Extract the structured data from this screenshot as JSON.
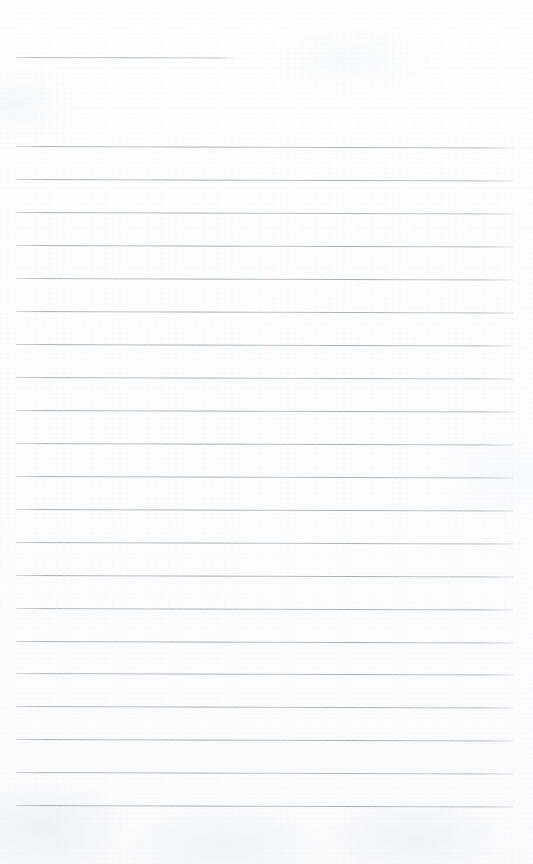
{
  "page": {
    "kind": "blank-ruled-paper",
    "width_px": 533,
    "height_px": 864,
    "background_color": "#fefefe",
    "paper_tone": "off-white",
    "visible_text": "",
    "text_content_note": "no handwriting, no printed text, no page numbers — page is blank"
  },
  "ruling": {
    "line_color": "#a5aab1",
    "line_thickness_px": 1,
    "line_spacing_px": 33,
    "skew_degrees": 0.16,
    "left_margin_px": 16,
    "right_edge_px": 513,
    "full_line_count": 21,
    "short_line_count": 1,
    "total_line_count": 22,
    "lines": [
      {
        "index": 0,
        "y": 57,
        "x_start": 16,
        "x_end": 234,
        "type": "short"
      },
      {
        "index": 1,
        "y": 146,
        "x_start": 16,
        "x_end": 513,
        "type": "full"
      },
      {
        "index": 2,
        "y": 179,
        "x_start": 16,
        "x_end": 513,
        "type": "full"
      },
      {
        "index": 3,
        "y": 212,
        "x_start": 16,
        "x_end": 513,
        "type": "full"
      },
      {
        "index": 4,
        "y": 245,
        "x_start": 16,
        "x_end": 513,
        "type": "full"
      },
      {
        "index": 5,
        "y": 278,
        "x_start": 16,
        "x_end": 513,
        "type": "full"
      },
      {
        "index": 6,
        "y": 311,
        "x_start": 16,
        "x_end": 513,
        "type": "full"
      },
      {
        "index": 7,
        "y": 344,
        "x_start": 16,
        "x_end": 513,
        "type": "full"
      },
      {
        "index": 8,
        "y": 377,
        "x_start": 16,
        "x_end": 513,
        "type": "full"
      },
      {
        "index": 9,
        "y": 410,
        "x_start": 16,
        "x_end": 513,
        "type": "full"
      },
      {
        "index": 10,
        "y": 443,
        "x_start": 16,
        "x_end": 513,
        "type": "full"
      },
      {
        "index": 11,
        "y": 476,
        "x_start": 16,
        "x_end": 513,
        "type": "full"
      },
      {
        "index": 12,
        "y": 509,
        "x_start": 16,
        "x_end": 513,
        "type": "full"
      },
      {
        "index": 13,
        "y": 542,
        "x_start": 16,
        "x_end": 513,
        "type": "full"
      },
      {
        "index": 14,
        "y": 575,
        "x_start": 16,
        "x_end": 513,
        "type": "full"
      },
      {
        "index": 15,
        "y": 608,
        "x_start": 16,
        "x_end": 513,
        "type": "full"
      },
      {
        "index": 16,
        "y": 641,
        "x_start": 16,
        "x_end": 513,
        "type": "full"
      },
      {
        "index": 17,
        "y": 673,
        "x_start": 16,
        "x_end": 513,
        "type": "full"
      },
      {
        "index": 18,
        "y": 706,
        "x_start": 16,
        "x_end": 513,
        "type": "full"
      },
      {
        "index": 19,
        "y": 739,
        "x_start": 16,
        "x_end": 513,
        "type": "full"
      },
      {
        "index": 20,
        "y": 772,
        "x_start": 16,
        "x_end": 513,
        "type": "full"
      },
      {
        "index": 21,
        "y": 805,
        "x_start": 16,
        "x_end": 513,
        "type": "full"
      }
    ]
  },
  "regions": {
    "top_margin": {
      "y_start": 0,
      "y_end": 56,
      "content": ""
    },
    "header_gap": {
      "y_start": 58,
      "y_end": 145,
      "content": ""
    },
    "bottom_margin": {
      "y_start": 806,
      "y_end": 864,
      "content": ""
    }
  }
}
